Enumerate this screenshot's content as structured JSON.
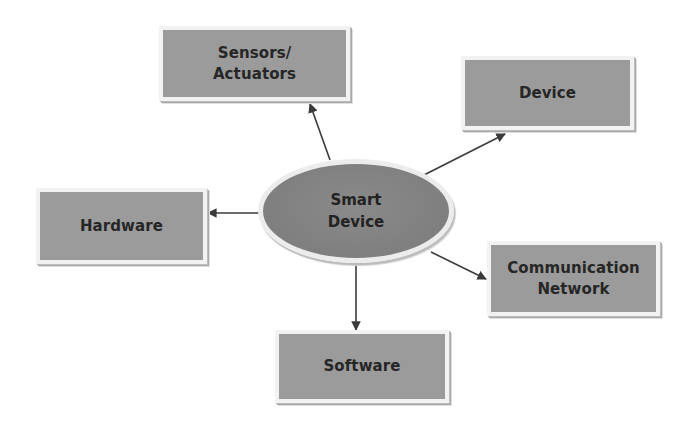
{
  "diagram": {
    "hub": {
      "label": "Smart\nDevice"
    },
    "nodes": {
      "sensors": {
        "label": "Sensors/\nActuators"
      },
      "device": {
        "label": "Device"
      },
      "hardware": {
        "label": "Hardware"
      },
      "communication": {
        "label": "Communication\nNetwork"
      },
      "software": {
        "label": "Software"
      }
    },
    "edges": [
      {
        "from": "Smart Device",
        "to": "Sensors/Actuators"
      },
      {
        "from": "Smart Device",
        "to": "Device"
      },
      {
        "from": "Smart Device",
        "to": "Hardware"
      },
      {
        "from": "Smart Device",
        "to": "Communication Network"
      },
      {
        "from": "Smart Device",
        "to": "Software"
      }
    ],
    "colors": {
      "box_fill": "#9b9b9b",
      "hub_fill": "#808080",
      "arrow": "#3a3a3a",
      "text": "#262626"
    }
  }
}
